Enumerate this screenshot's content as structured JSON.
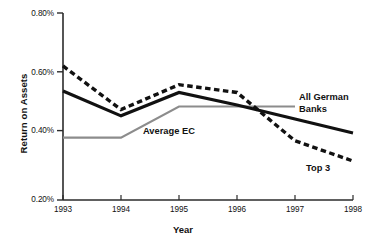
{
  "chart_data": {
    "type": "line",
    "title": "",
    "xlabel": "Year",
    "ylabel": "Return on Assets",
    "x": [
      1993,
      1994,
      1995,
      1996,
      1997,
      1998
    ],
    "xticklabels": [
      "1993",
      "1994",
      "1995",
      "1996",
      "1997",
      "1998"
    ],
    "yticklabels": [
      "0.80%",
      "0.60%",
      "0.40%",
      "0.20%"
    ],
    "ytickvalues": [
      0.8,
      0.6,
      0.4,
      0.2
    ],
    "ylim": [
      0.2,
      0.8
    ],
    "xlim": [
      1993,
      1998
    ],
    "grid": false,
    "legend_position": "inline-annotations",
    "series": [
      {
        "name": "Top 3",
        "style": "dashed",
        "color": "#111111",
        "x": [
          1993,
          1994,
          1995,
          1996,
          1997,
          1998
        ],
        "values": [
          0.63,
          0.49,
          0.57,
          0.545,
          0.39,
          0.325
        ]
      },
      {
        "name": "All German Banks",
        "style": "solid",
        "color": "#111111",
        "x": [
          1993,
          1994,
          1995,
          1996,
          1997,
          1998
        ],
        "values": [
          0.55,
          0.47,
          0.545,
          0.505,
          0.46,
          0.415
        ]
      },
      {
        "name": "Average EC",
        "style": "solid-thin",
        "color": "#8c8c8c",
        "x": [
          1993,
          1994,
          1995,
          1996,
          1997
        ],
        "values": [
          0.4,
          0.4,
          0.5,
          0.5,
          0.5
        ]
      }
    ],
    "annotations": [
      {
        "text": "All German\nBanks",
        "series": "All German Banks"
      },
      {
        "text": "Top 3",
        "series": "Top 3"
      },
      {
        "text": "Average EC",
        "series": "Average EC"
      }
    ]
  }
}
